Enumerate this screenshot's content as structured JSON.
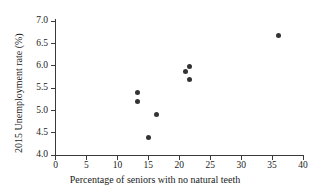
{
  "chart_data": {
    "type": "scatter",
    "title": "",
    "xlabel": "Percentage of seniors with no natural teeth",
    "ylabel": "2015 Unemployment rate (%)",
    "xlim": [
      0,
      40
    ],
    "ylim": [
      4.0,
      7.0
    ],
    "xticks": [
      0,
      5,
      10,
      15,
      20,
      25,
      30,
      35,
      40
    ],
    "xtick_labels": [
      "0",
      "5",
      "10",
      "15",
      "20",
      "25",
      "30",
      "35",
      "40"
    ],
    "yticks": [
      4.0,
      4.5,
      5.0,
      5.5,
      6.0,
      6.5,
      7.0
    ],
    "ytick_labels": [
      "4.0",
      "4.5",
      "5.0",
      "5.5",
      "6.0",
      "6.5",
      "7.0"
    ],
    "grid": false,
    "legend": false,
    "marker": "filled-circle",
    "marker_color": "#333333",
    "axis_color": "#3a3a3a",
    "points": [
      {
        "x": 13.3,
        "y": 5.4
      },
      {
        "x": 13.2,
        "y": 5.2
      },
      {
        "x": 16.4,
        "y": 4.9
      },
      {
        "x": 15.0,
        "y": 4.4
      },
      {
        "x": 21.0,
        "y": 5.88
      },
      {
        "x": 21.7,
        "y": 5.98
      },
      {
        "x": 21.6,
        "y": 5.68
      },
      {
        "x": 36.1,
        "y": 6.68
      }
    ]
  }
}
